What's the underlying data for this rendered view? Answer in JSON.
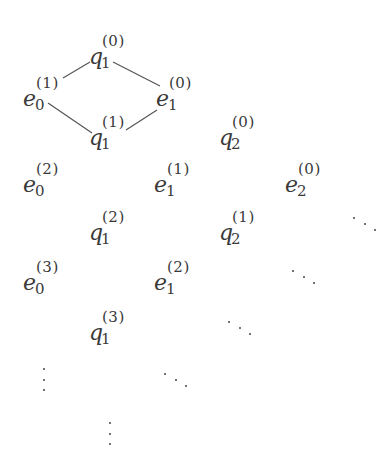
{
  "diagram": {
    "title": "",
    "nodes": [
      {
        "id": "q1_0",
        "base": "q",
        "sub": "1",
        "sup": "(0)",
        "x": 89,
        "y": 36
      },
      {
        "id": "e0_1",
        "base": "e",
        "sub": "0",
        "sup": "(1)",
        "x": 23,
        "y": 78
      },
      {
        "id": "e1_0",
        "base": "e",
        "sub": "1",
        "sup": "(0)",
        "x": 156,
        "y": 78
      },
      {
        "id": "q1_1",
        "base": "q",
        "sub": "1",
        "sup": "(1)",
        "x": 89,
        "y": 117
      },
      {
        "id": "q2_0",
        "base": "q",
        "sub": "2",
        "sup": "(0)",
        "x": 219,
        "y": 117
      },
      {
        "id": "e0_2",
        "base": "e",
        "sub": "0",
        "sup": "(2)",
        "x": 23,
        "y": 164
      },
      {
        "id": "e1_1",
        "base": "e",
        "sub": "1",
        "sup": "(1)",
        "x": 154,
        "y": 164
      },
      {
        "id": "e2_0",
        "base": "e",
        "sub": "2",
        "sup": "(0)",
        "x": 285,
        "y": 164
      },
      {
        "id": "q1_2",
        "base": "q",
        "sub": "1",
        "sup": "(2)",
        "x": 89,
        "y": 212
      },
      {
        "id": "q2_1",
        "base": "q",
        "sub": "2",
        "sup": "(1)",
        "x": 219,
        "y": 212
      },
      {
        "id": "e0_3",
        "base": "e",
        "sub": "0",
        "sup": "(3)",
        "x": 23,
        "y": 262
      },
      {
        "id": "e1_2",
        "base": "e",
        "sub": "1",
        "sup": "(2)",
        "x": 154,
        "y": 262
      },
      {
        "id": "q1_3",
        "base": "q",
        "sub": "1",
        "sup": "(3)",
        "x": 89,
        "y": 312
      }
    ],
    "edges": [
      {
        "from": "e0_1",
        "to": "q1_0",
        "x1": 63,
        "y1": 78,
        "x2": 90,
        "y2": 62
      },
      {
        "from": "q1_0",
        "to": "e1_0",
        "x1": 113,
        "y1": 62,
        "x2": 160,
        "y2": 86
      },
      {
        "from": "e0_1",
        "to": "q1_1",
        "x1": 48,
        "y1": 103,
        "x2": 92,
        "y2": 133
      },
      {
        "from": "q1_1",
        "to": "e1_0",
        "x1": 126,
        "y1": 130,
        "x2": 157,
        "y2": 110
      }
    ],
    "ellipses": [
      {
        "id": "ddots-1",
        "kind": "diagonal",
        "x": 353,
        "y": 217
      },
      {
        "id": "ddots-2",
        "kind": "diagonal",
        "x": 292,
        "y": 270
      },
      {
        "id": "ddots-3",
        "kind": "diagonal",
        "x": 228,
        "y": 321
      },
      {
        "id": "vdots-1",
        "kind": "vertical",
        "x": 43,
        "y": 368
      },
      {
        "id": "ddots-4",
        "kind": "diagonal",
        "x": 164,
        "y": 373
      },
      {
        "id": "vdots-2",
        "kind": "vertical",
        "x": 109,
        "y": 422
      }
    ]
  },
  "colors": {
    "ink": "#3a3a3a",
    "line": "#555555",
    "background": "#ffffff"
  }
}
